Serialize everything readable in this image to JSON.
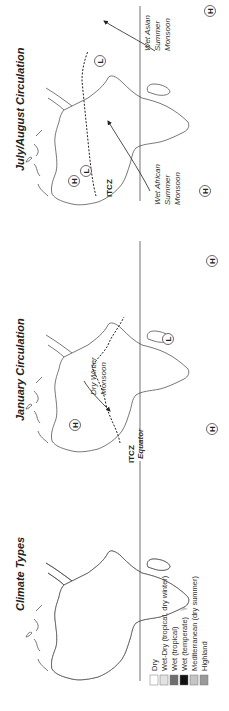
{
  "panels": {
    "climate": {
      "title": "Climate Types",
      "equator_label": "Equator",
      "legend": [
        {
          "label": "Dry",
          "color": "#ffffff"
        },
        {
          "label": "Wet-Dry (tropical, dry winter)",
          "color": "#e2e2e2"
        },
        {
          "label": "Wet (tropical)",
          "color": "#6e6e6e"
        },
        {
          "label": "Wet (temperate)",
          "color": "#111111"
        },
        {
          "label": "Mediterranean (dry summer)",
          "color": "#c4c4c4"
        },
        {
          "label": "Highland",
          "color": "#9a9a9a"
        }
      ]
    },
    "january": {
      "title": "January Circulation",
      "itcz_label": "ITCZ",
      "monsoon_label_1": "Dry Winter",
      "monsoon_label_2": "Monsoon",
      "pressure": {
        "high": "H",
        "low": "L"
      }
    },
    "july": {
      "title": "July/August Circulation",
      "itcz_label": "ITCZ",
      "west_africa_1": "Wet African",
      "west_africa_2": "Summer",
      "west_africa_3": "Monsoon",
      "asia_1": "Wet Asian",
      "asia_2": "Summer",
      "asia_3": "Monsoon",
      "pressure": {
        "high": "H",
        "low": "L"
      }
    }
  }
}
